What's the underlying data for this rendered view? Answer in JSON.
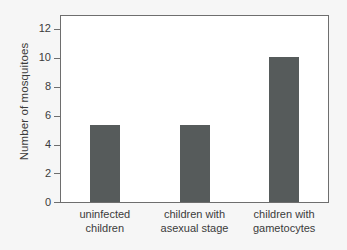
{
  "chart_data": {
    "type": "bar",
    "title": "",
    "subtitle": "",
    "xlabel": "",
    "ylabel": "Number of mosquitoes",
    "categories": [
      "uninfected children",
      "children with asexual stage",
      "children with gametocytes"
    ],
    "category_lines": [
      [
        "uninfected",
        "children"
      ],
      [
        "children with",
        "asexual stage"
      ],
      [
        "children with",
        "gametocytes"
      ]
    ],
    "values": [
      5.4,
      5.4,
      10.1
    ],
    "ylim": [
      0,
      13
    ],
    "yticks": [
      0,
      2,
      4,
      6,
      8,
      10,
      12
    ],
    "ytick_labels": [
      "0",
      "2",
      "4",
      "6",
      "8",
      "10",
      "12"
    ],
    "xticks": [],
    "grid": false,
    "legend": null,
    "legend_position": "none",
    "bar_color": "#565b5b",
    "axis_color": "#6e6e6e",
    "plot_background": "#ffffff",
    "figure_background": "#f6f6f6",
    "text_color": "#3b3b3b"
  }
}
